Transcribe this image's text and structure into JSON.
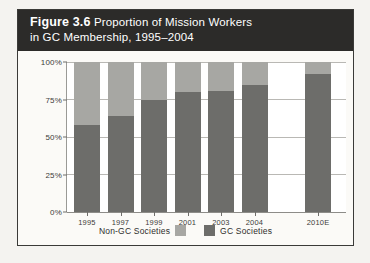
{
  "figure": {
    "title_strong": "Figure 3.6",
    "title_rest": " Proportion of Mission Workers",
    "title_line2": "in GC Membership, 1995–2004"
  },
  "colors": {
    "band_background": "#2c2b29",
    "band_text": "#ffffff",
    "page_background": "#f4f3f0",
    "frame_border": "#3a3a38",
    "plot_background": "#ffffff",
    "gridline": "#b9b8b4",
    "series_gc": "#6d6d6a",
    "series_non_gc": "#a7a7a3"
  },
  "chart_data": {
    "type": "bar",
    "subtype": "stacked-percentage",
    "title": "Figure 3.6 Proportion of Mission Workers in GC Membership, 1995–2004",
    "xlabel": "",
    "ylabel": "",
    "ylim": [
      0,
      100
    ],
    "yticks": [
      0,
      25,
      50,
      75,
      100
    ],
    "ytick_labels": [
      "0%",
      "25%",
      "50%",
      "75%",
      "100%"
    ],
    "grid": true,
    "legend_position": "bottom-center",
    "categories": [
      "1995",
      "1997",
      "1999",
      "2001",
      "2003",
      "2004",
      "2010E"
    ],
    "series": [
      {
        "name": "GC Societies",
        "color": "#6d6d6a",
        "values": [
          58,
          64,
          75,
          80,
          81,
          85,
          92
        ]
      },
      {
        "name": "Non-GC Societies",
        "color": "#a7a7a3",
        "values": [
          42,
          36,
          25,
          20,
          19,
          15,
          8
        ]
      }
    ]
  },
  "legend": {
    "non_gc_label": "Non-GC Societies",
    "gc_label": "GC Societies"
  }
}
